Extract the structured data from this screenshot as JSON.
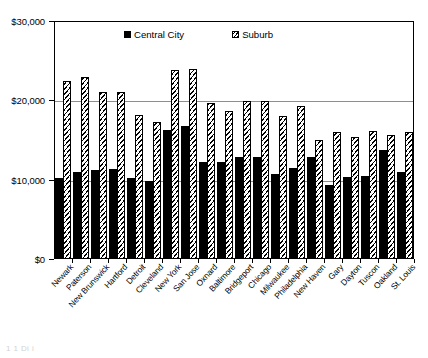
{
  "chart_data": {
    "type": "bar",
    "title": "",
    "xlabel": "",
    "ylabel": "",
    "ylim": [
      0,
      30000
    ],
    "grid": true,
    "legend_position": "top-inside",
    "ytick_labels": [
      "$0",
      "$10,000",
      "$20,000",
      "$30,000"
    ],
    "ytick_values": [
      0,
      10000,
      20000,
      30000
    ],
    "categories": [
      "Newark",
      "Paterson",
      "New Brunswick",
      "Hartford",
      "Detroit",
      "Cleveland",
      "New York",
      "San Jose",
      "Oxnard",
      "Baltimore",
      "Bridgeport",
      "Chicago",
      "Milwaukee",
      "Philadelphia",
      "New Haven",
      "Gary",
      "Dayton",
      "Tuscon",
      "Oakland",
      "St. Louis"
    ],
    "series": [
      {
        "name": "Central City",
        "color": "#000000",
        "pattern": "solid",
        "values": [
          10200,
          11000,
          11200,
          11300,
          10200,
          9800,
          16200,
          16800,
          12200,
          12200,
          12800,
          12900,
          10700,
          11500,
          12900,
          9300,
          10300,
          10500,
          13800,
          11000
        ]
      },
      {
        "name": "Suburb",
        "color": "#ffffff",
        "pattern": "diagonal-hatch",
        "values": [
          22400,
          23000,
          21000,
          21000,
          18100,
          17300,
          23800,
          24000,
          19700,
          18700,
          19900,
          19900,
          18000,
          19300,
          15000,
          16000,
          15400,
          16100,
          15600,
          16000
        ]
      }
    ]
  },
  "legend": {
    "entries": [
      {
        "label": "Central City",
        "swatch": "solid-black-square"
      },
      {
        "label": "Suburb",
        "swatch": "hatched-white-square"
      }
    ]
  },
  "caption_remnant": "1 1 Di i",
  "icons": {
    "legend_swatch_central": "filled-square-icon",
    "legend_swatch_suburb": "hatched-square-icon"
  }
}
